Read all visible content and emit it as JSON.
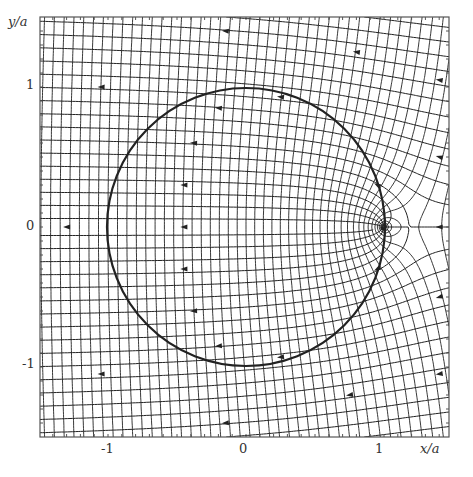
{
  "figure": {
    "title": "",
    "x_axis": {
      "label": "x/a",
      "ticks": [
        {
          "value": -1,
          "label": "-1"
        },
        {
          "value": 0,
          "label": "0"
        },
        {
          "value": 1,
          "label": "1"
        }
      ]
    },
    "y_axis": {
      "label": "y/a",
      "ticks": [
        {
          "value": 1,
          "label": "1"
        },
        {
          "value": 0,
          "label": "0"
        },
        {
          "value": -1,
          "label": "-1"
        }
      ]
    },
    "range": {
      "xmin": -1.5,
      "xmax": 1.5,
      "ymin": -1.5,
      "ymax": 1.5
    },
    "circle": {
      "cx": 0,
      "cy": 0,
      "r": 1
    },
    "stagnation_point": {
      "x": 1.18,
      "y": 0
    },
    "line_styles": {
      "field_lines": "solid",
      "equipotentials": "dashed"
    },
    "colors": {
      "ink": "#222222",
      "frame": "#555555",
      "background": "#ffffff"
    }
  },
  "layout": {
    "frame": {
      "left": 40,
      "top": 17,
      "right": 449,
      "bottom": 437
    },
    "plot_center": {
      "x": 246,
      "y": 227
    },
    "unit_px_x": 138,
    "unit_px_y": 140
  },
  "labels": {
    "x_title": "x/a",
    "y_title": "y/a",
    "x_ticks": [
      "-1",
      "0",
      "1"
    ],
    "y_ticks": [
      "1",
      "0",
      "-1"
    ]
  }
}
